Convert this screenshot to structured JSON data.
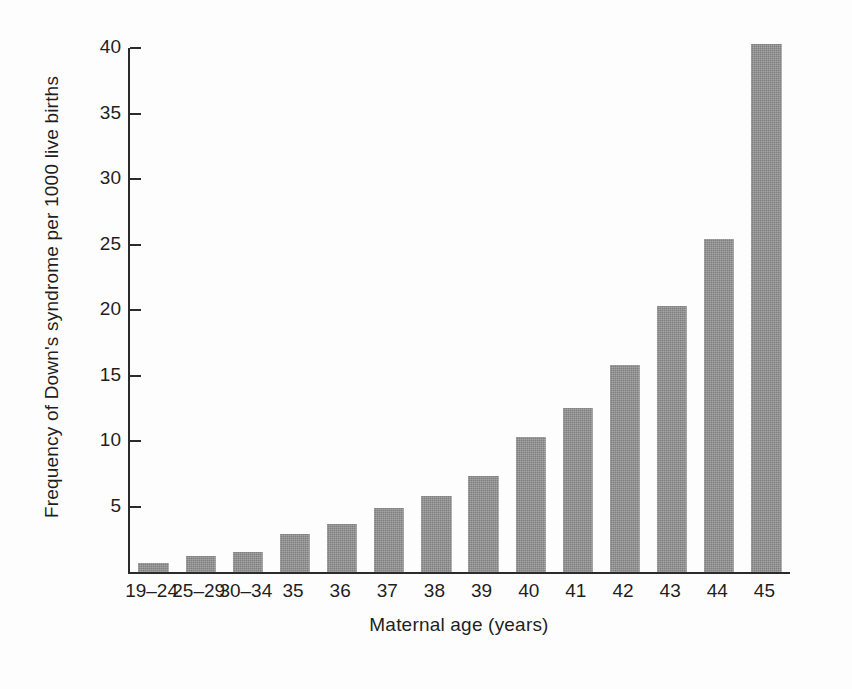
{
  "chart_data": {
    "type": "bar",
    "title": "",
    "xlabel": "Maternal age (years)",
    "ylabel": "Frequency of Down's syndrome per 1000 live births",
    "categories": [
      "19–24",
      "25–29",
      "30–34",
      "35",
      "36",
      "37",
      "38",
      "39",
      "40",
      "41",
      "42",
      "43",
      "44",
      "45"
    ],
    "values": [
      0.7,
      1.2,
      1.5,
      2.9,
      3.7,
      4.9,
      5.8,
      7.3,
      10.3,
      12.5,
      15.8,
      20.3,
      25.4,
      40.3
    ],
    "series": [
      {
        "name": "Frequency of Down's syndrome per 1000 live births",
        "values": [
          0.7,
          1.2,
          1.5,
          2.9,
          3.7,
          4.9,
          5.8,
          7.3,
          10.3,
          12.5,
          15.8,
          20.3,
          25.4,
          40.3
        ]
      }
    ],
    "ylim": [
      0,
      40
    ],
    "yticks": [
      5,
      10,
      15,
      20,
      25,
      30,
      35,
      40
    ],
    "ytick_labels": [
      "5",
      "10",
      "15",
      "20",
      "25",
      "30",
      "35",
      "40"
    ],
    "grid": false,
    "legend": false,
    "legend_position": "none",
    "bar_color": "#8d8d8d",
    "axis_color": "#2b2b2b",
    "background_color": "#ffffff"
  }
}
